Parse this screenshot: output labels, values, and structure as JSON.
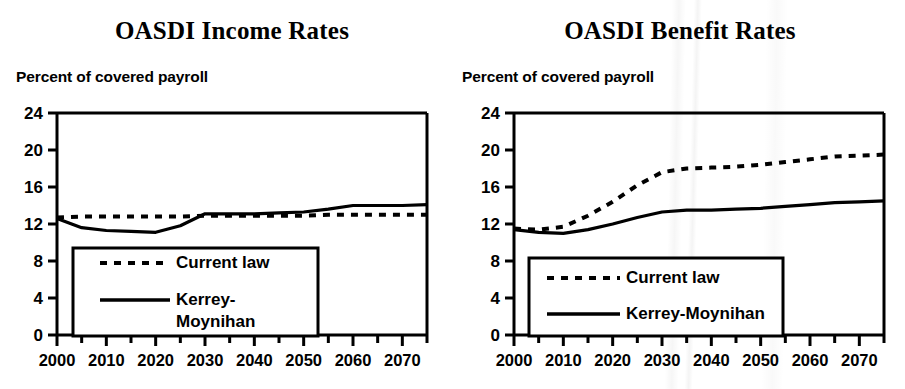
{
  "charts": [
    {
      "title": "OASDI Income Rates",
      "axis_caption": "Percent of covered payroll",
      "legend": {
        "current_law": "Current law",
        "kerrey_line1": "Kerrey-",
        "kerrey_line2": "Moynihan",
        "kerrey_full": "Kerrey-Moynihan"
      }
    },
    {
      "title": "OASDI Benefit Rates",
      "axis_caption": "Percent of covered payroll",
      "legend": {
        "current_law": "Current law",
        "kerrey_line1": "Kerrey-Moynihan",
        "kerrey_line2": "",
        "kerrey_full": "Kerrey-Moynihan"
      }
    }
  ],
  "chart_data": [
    {
      "type": "line",
      "title": "OASDI Income Rates",
      "xlabel": "",
      "ylabel": "Percent of covered payroll",
      "xlim": [
        2000,
        2075
      ],
      "ylim": [
        0,
        24
      ],
      "yticks": [
        0,
        4,
        8,
        12,
        16,
        20,
        24
      ],
      "xticks": [
        2000,
        2005,
        2010,
        2015,
        2020,
        2025,
        2030,
        2035,
        2040,
        2045,
        2050,
        2055,
        2060,
        2065,
        2070,
        2075
      ],
      "xticklabels": [
        "2000",
        "2010",
        "2020",
        "2030",
        "2040",
        "2050",
        "2060",
        "2070"
      ],
      "xticklabel_values": [
        2000,
        2010,
        2020,
        2030,
        2040,
        2050,
        2060,
        2070
      ],
      "grid": false,
      "legend_position": "lower-left",
      "x": [
        2000,
        2005,
        2010,
        2015,
        2020,
        2025,
        2030,
        2035,
        2040,
        2045,
        2050,
        2055,
        2060,
        2065,
        2070,
        2075
      ],
      "series": [
        {
          "name": "Current law",
          "style": "dashed",
          "values": [
            12.7,
            12.8,
            12.8,
            12.8,
            12.8,
            12.8,
            12.9,
            12.9,
            12.9,
            12.9,
            12.9,
            13.0,
            13.0,
            13.0,
            13.0,
            13.0
          ]
        },
        {
          "name": "Kerrey-Moynihan",
          "style": "solid",
          "values": [
            12.6,
            11.6,
            11.3,
            11.2,
            11.1,
            11.8,
            13.1,
            13.1,
            13.1,
            13.2,
            13.3,
            13.6,
            14.0,
            14.0,
            14.0,
            14.1
          ]
        }
      ]
    },
    {
      "type": "line",
      "title": "OASDI Benefit Rates",
      "xlabel": "",
      "ylabel": "Percent of covered payroll",
      "xlim": [
        2000,
        2075
      ],
      "ylim": [
        0,
        24
      ],
      "yticks": [
        0,
        4,
        8,
        12,
        16,
        20,
        24
      ],
      "xticks": [
        2000,
        2005,
        2010,
        2015,
        2020,
        2025,
        2030,
        2035,
        2040,
        2045,
        2050,
        2055,
        2060,
        2065,
        2070,
        2075
      ],
      "xticklabels": [
        "2000",
        "2010",
        "2020",
        "2030",
        "2040",
        "2050",
        "2060",
        "2070"
      ],
      "xticklabel_values": [
        2000,
        2010,
        2020,
        2030,
        2040,
        2050,
        2060,
        2070
      ],
      "grid": false,
      "legend_position": "lower-left",
      "x": [
        2000,
        2005,
        2010,
        2015,
        2020,
        2025,
        2030,
        2035,
        2040,
        2045,
        2050,
        2055,
        2060,
        2065,
        2070,
        2075
      ],
      "series": [
        {
          "name": "Current law",
          "style": "dashed",
          "values": [
            11.5,
            11.4,
            11.7,
            12.9,
            14.4,
            16.2,
            17.6,
            18.0,
            18.1,
            18.2,
            18.4,
            18.7,
            19.0,
            19.3,
            19.4,
            19.5
          ]
        },
        {
          "name": "Kerrey-Moynihan",
          "style": "solid",
          "values": [
            11.4,
            11.1,
            11.0,
            11.4,
            12.0,
            12.7,
            13.3,
            13.5,
            13.5,
            13.6,
            13.7,
            13.9,
            14.1,
            14.3,
            14.4,
            14.5
          ]
        }
      ]
    }
  ],
  "colors": {
    "ink": "#000000",
    "background": "#ffffff"
  }
}
